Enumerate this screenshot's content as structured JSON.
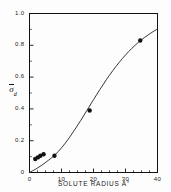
{
  "chart_data": {
    "type": "scatter",
    "title": "",
    "subtitle": "",
    "xlabel": "SOLUTE RADIUS A°",
    "ylabel": "σ̄d",
    "ylabel_symbol": "σ",
    "ylabel_subscript": "d",
    "xlim": [
      0,
      40
    ],
    "ylim": [
      0,
      1.0
    ],
    "grid": false,
    "legend": "none",
    "xticks": [
      0,
      10,
      20,
      30,
      40
    ],
    "xtick_labels": [
      "0",
      "10",
      "20",
      "30",
      "40"
    ],
    "xminor_step": 2.5,
    "yticks": [
      0,
      0.2,
      0.4,
      0.6,
      0.8,
      1.0
    ],
    "ytick_labels": [
      "0",
      "0.2",
      "0.4",
      "0.6",
      "0.8",
      "1.0"
    ],
    "yminor_step": 0.1,
    "marker": "filled-circle",
    "marker_color": "#111111",
    "line_color": "#222222",
    "points": [
      {
        "x": 1.8,
        "y": 0.085
      },
      {
        "x": 2.6,
        "y": 0.095
      },
      {
        "x": 3.4,
        "y": 0.105
      },
      {
        "x": 4.4,
        "y": 0.115
      },
      {
        "x": 7.8,
        "y": 0.105
      },
      {
        "x": 18.8,
        "y": 0.39
      },
      {
        "x": 34.6,
        "y": 0.83
      }
    ],
    "series": [
      {
        "name": "fitted curve",
        "x": [
          0,
          2,
          4,
          6,
          8,
          10,
          12,
          14,
          16,
          18,
          20,
          22,
          24,
          26,
          28,
          30,
          32,
          34,
          36,
          38,
          40
        ],
        "y": [
          0.0,
          0.022,
          0.048,
          0.078,
          0.112,
          0.155,
          0.207,
          0.265,
          0.327,
          0.392,
          0.458,
          0.522,
          0.583,
          0.64,
          0.692,
          0.739,
          0.781,
          0.818,
          0.85,
          0.878,
          0.903
        ]
      }
    ]
  },
  "axes": {
    "x_title": "SOLUTE RADIUS A°"
  }
}
